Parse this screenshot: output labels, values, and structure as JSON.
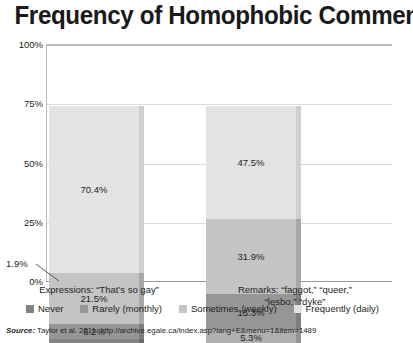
{
  "title": "Frequency of Homophobic Comments",
  "source": {
    "label": "Source:",
    "text": " Taylor et al. 2011. http://archive.egale.ca/index.asp?lang+E&menu=1&item=1489"
  },
  "callout": {
    "value": "1.9%"
  },
  "legend": [
    {
      "label": "Never",
      "color": "#828282"
    },
    {
      "label": "Rarely (monthly)",
      "color": "#969696"
    },
    {
      "label": "Sometimes (weekly)",
      "color": "#c4c4c4"
    },
    {
      "label": "Frequently (daily)",
      "color": "#e3e3e3"
    }
  ],
  "chart_data": {
    "type": "bar",
    "subtype": "stacked-100-percent",
    "title": "Frequency of Homophobic Comments",
    "xlabel": "",
    "ylabel": "",
    "ylim": [
      0,
      100
    ],
    "yticks": [
      "0%",
      "25%",
      "50%",
      "75%",
      "100%"
    ],
    "grid": true,
    "legend_position": "bottom",
    "categories": [
      "Expressions: “That’s so gay”",
      "Remarks: “faggot,” “queer,” “lesbo,” “dyke”"
    ],
    "category_lines": [
      [
        "Expressions: “That’s so gay”"
      ],
      [
        "Remarks: “faggot,” “queer,”",
        "“lesbo,” “dyke”"
      ]
    ],
    "series": [
      {
        "name": "Never",
        "color": "#828282",
        "values": [
          1.9,
          5.3
        ],
        "labels": [
          "1.9%",
          "5.3%"
        ]
      },
      {
        "name": "Rarely (monthly)",
        "color": "#969696",
        "values": [
          6.2,
          15.3
        ],
        "labels": [
          "6.2%",
          "15.3%"
        ]
      },
      {
        "name": "Sometimes (weekly)",
        "color": "#c4c4c4",
        "values": [
          21.5,
          31.9
        ],
        "labels": [
          "21.5%",
          "31.9%"
        ]
      },
      {
        "name": "Frequently (daily)",
        "color": "#e3e3e3",
        "values": [
          70.4,
          47.5
        ],
        "labels": [
          "70.4%",
          "47.5%"
        ]
      }
    ]
  },
  "bars": {
    "expressions": {
      "segments": [
        {
          "series": "Frequently (daily)",
          "value": 70.4,
          "label": "70.4%",
          "color": "#e3e3e3",
          "side": "#cfcfcf",
          "show_label": true
        },
        {
          "series": "Sometimes (weekly)",
          "value": 21.5,
          "label": "21.5%",
          "color": "#c4c4c4",
          "side": "#a8a8a8",
          "show_label": true
        },
        {
          "series": "Rarely (monthly)",
          "value": 6.2,
          "label": "6.2%",
          "color": "#969696",
          "side": "#7e7e7e",
          "show_label": true
        },
        {
          "series": "Never",
          "value": 1.9,
          "label": "1.9%",
          "color": "#828282",
          "side": "#6b6b6b",
          "show_label": false
        }
      ]
    },
    "remarks": {
      "segments": [
        {
          "series": "Frequently (daily)",
          "value": 47.5,
          "label": "47.5%",
          "color": "#e3e3e3",
          "side": "#cfcfcf",
          "show_label": true
        },
        {
          "series": "Sometimes (weekly)",
          "value": 31.9,
          "label": "31.9%",
          "color": "#c4c4c4",
          "side": "#a8a8a8",
          "show_label": true
        },
        {
          "series": "Rarely (monthly)",
          "value": 15.3,
          "label": "15.3%",
          "color": "#969696",
          "side": "#7e7e7e",
          "show_label": true
        },
        {
          "series": "Never",
          "value": 5.3,
          "label": "5.3%",
          "color": "#b0b0b0",
          "side": "#949494",
          "show_label": true
        }
      ]
    }
  }
}
